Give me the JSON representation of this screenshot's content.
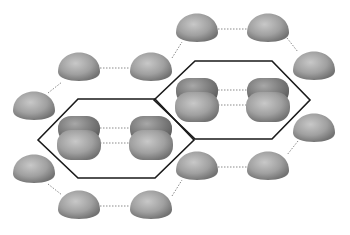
{
  "diagram": {
    "colors": {
      "background": "#ffffff",
      "sphere_light": "#c4c4c4",
      "sphere_mid": "#9a9a9a",
      "sphere_dark": "#6e6e6e",
      "hexagon_stroke": "#1a1a1a",
      "dotted_line": "#8a8a8a"
    },
    "hexagons": [
      {
        "points": [
          [
            38,
            140
          ],
          [
            78,
            99
          ],
          [
            155,
            99
          ],
          [
            194,
            140
          ],
          [
            155,
            178
          ],
          [
            78,
            178
          ]
        ]
      },
      {
        "points": [
          [
            154,
            100
          ],
          [
            195,
            61
          ],
          [
            272,
            61
          ],
          [
            310,
            100
          ],
          [
            272,
            139
          ],
          [
            195,
            139
          ]
        ]
      }
    ],
    "spheres": [
      {
        "cx": 197,
        "cy": 29,
        "rx": 21,
        "ry": 18
      },
      {
        "cx": 268,
        "cy": 29,
        "rx": 21,
        "ry": 18
      },
      {
        "cx": 314,
        "cy": 67,
        "rx": 21,
        "ry": 18
      },
      {
        "cx": 79,
        "cy": 68,
        "rx": 21,
        "ry": 18
      },
      {
        "cx": 151,
        "cy": 68,
        "rx": 21,
        "ry": 18
      },
      {
        "cx": 34,
        "cy": 107,
        "rx": 21,
        "ry": 18
      },
      {
        "cx": 314,
        "cy": 129,
        "rx": 21,
        "ry": 18
      },
      {
        "cx": 34,
        "cy": 170,
        "rx": 21,
        "ry": 18
      },
      {
        "cx": 197,
        "cy": 167,
        "rx": 21,
        "ry": 18
      },
      {
        "cx": 268,
        "cy": 167,
        "rx": 21,
        "ry": 18
      },
      {
        "cx": 79,
        "cy": 206,
        "rx": 21,
        "ry": 18
      },
      {
        "cx": 151,
        "cy": 206,
        "rx": 21,
        "ry": 18
      }
    ],
    "lobed_spheres": [
      {
        "cx": 79,
        "cy": 138
      },
      {
        "cx": 151,
        "cy": 138
      },
      {
        "cx": 197,
        "cy": 100
      },
      {
        "cx": 268,
        "cy": 100
      }
    ],
    "dotted_links": [
      [
        [
          218,
          29
        ],
        [
          247,
          29
        ]
      ],
      [
        [
          287,
          38
        ],
        [
          298,
          52
        ]
      ],
      [
        [
          100,
          68
        ],
        [
          130,
          68
        ]
      ],
      [
        [
          172,
          58
        ],
        [
          182,
          42
        ]
      ],
      [
        [
          48,
          93
        ],
        [
          62,
          82
        ]
      ],
      [
        [
          100,
          128
        ],
        [
          130,
          128
        ]
      ],
      [
        [
          100,
          143
        ],
        [
          130,
          143
        ]
      ],
      [
        [
          218,
          90
        ],
        [
          247,
          90
        ]
      ],
      [
        [
          218,
          105
        ],
        [
          247,
          105
        ]
      ],
      [
        [
          298,
          141
        ],
        [
          287,
          155
        ]
      ],
      [
        [
          218,
          167
        ],
        [
          247,
          167
        ]
      ],
      [
        [
          48,
          184
        ],
        [
          62,
          195
        ]
      ],
      [
        [
          100,
          206
        ],
        [
          130,
          206
        ]
      ],
      [
        [
          172,
          196
        ],
        [
          182,
          180
        ]
      ]
    ]
  }
}
